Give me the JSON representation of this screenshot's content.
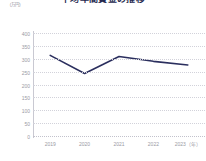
{
  "chart_data": {
    "type": "line",
    "title": "平均年間賃金の推移",
    "unit_label": "（万円）",
    "categories": [
      "2019",
      "2020",
      "2021",
      "2022",
      "2023"
    ],
    "x_axis_suffix": "（年）",
    "xtick_labels": [
      "2019",
      "2020",
      "2021",
      "2022",
      "2023（年）"
    ],
    "series": [
      {
        "name": "平均年間賃金",
        "values": [
          313,
          243,
          309,
          290,
          276
        ],
        "color": "#2b2f5e"
      }
    ],
    "ylim": [
      0,
      400
    ],
    "ytick_values": [
      400,
      350,
      300,
      250,
      200,
      150,
      100,
      50,
      0
    ],
    "ytick_labels": [
      "400",
      "350",
      "300",
      "250",
      "200",
      "150",
      "100",
      "50",
      "0"
    ],
    "xlabel": "",
    "ylabel": "",
    "grid": true,
    "grid_style": "dotted-horizontal",
    "legend": false,
    "markers": false,
    "colors": {
      "line": "#2b2f5e",
      "grid": "#d2d2da",
      "axis": "#c9c9d2",
      "tick_text": "#9a9aa4",
      "title_text": "#26294f",
      "background": "#ffffff"
    }
  }
}
